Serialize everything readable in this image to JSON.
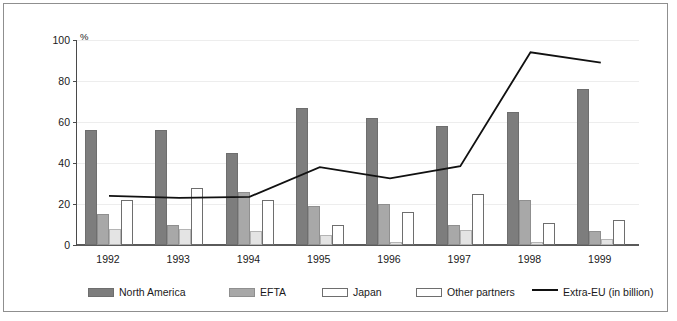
{
  "axis": {
    "unit_label": "%",
    "y_ticks": [
      0,
      20,
      40,
      60,
      80,
      100
    ],
    "x_labels": [
      "1992",
      "1993",
      "1994",
      "1995",
      "1996",
      "1997",
      "1998",
      "1999"
    ]
  },
  "legend": {
    "items": [
      {
        "label": "North America",
        "swatch": "bar-swatch-dark-gray",
        "color": "#7d7d7d"
      },
      {
        "label": "EFTA",
        "swatch": "bar-swatch-mid-gray",
        "color": "#a8a8a8"
      },
      {
        "label": "Japan",
        "swatch": "bar-swatch-light",
        "color": "#e4e4e4"
      },
      {
        "label": "Other partners",
        "swatch": "bar-swatch-white",
        "color": "#ffffff"
      },
      {
        "label": "Extra-EU (in billion)",
        "swatch": "line-swatch-black",
        "color": "#111111"
      }
    ]
  },
  "chart_data": {
    "type": "bar",
    "title": "",
    "xlabel": "",
    "ylabel": "%",
    "ylim": [
      0,
      100
    ],
    "grid": true,
    "legend_position": "bottom",
    "categories": [
      "1992",
      "1993",
      "1994",
      "1995",
      "1996",
      "1997",
      "1998",
      "1999"
    ],
    "series": [
      {
        "name": "North America",
        "kind": "bar",
        "color": "#7d7d7d",
        "values": [
          56,
          56,
          45,
          67,
          62,
          58,
          65,
          76
        ]
      },
      {
        "name": "EFTA",
        "kind": "bar",
        "color": "#a8a8a8",
        "values": [
          15,
          10,
          26,
          19,
          20,
          10,
          22,
          7
        ]
      },
      {
        "name": "Japan",
        "kind": "bar",
        "color": "#e4e4e4",
        "values": [
          8,
          8,
          7,
          5,
          1.5,
          7.5,
          1.5,
          3
        ]
      },
      {
        "name": "Other partners",
        "kind": "bar",
        "color": "#ffffff",
        "values": [
          22,
          28,
          22,
          10,
          16,
          25,
          10.5,
          12
        ]
      },
      {
        "name": "Extra-EU (in billion)",
        "kind": "line",
        "color": "#111111",
        "values": [
          24,
          23,
          23.5,
          38,
          32.5,
          38.5,
          94,
          89
        ]
      }
    ]
  }
}
